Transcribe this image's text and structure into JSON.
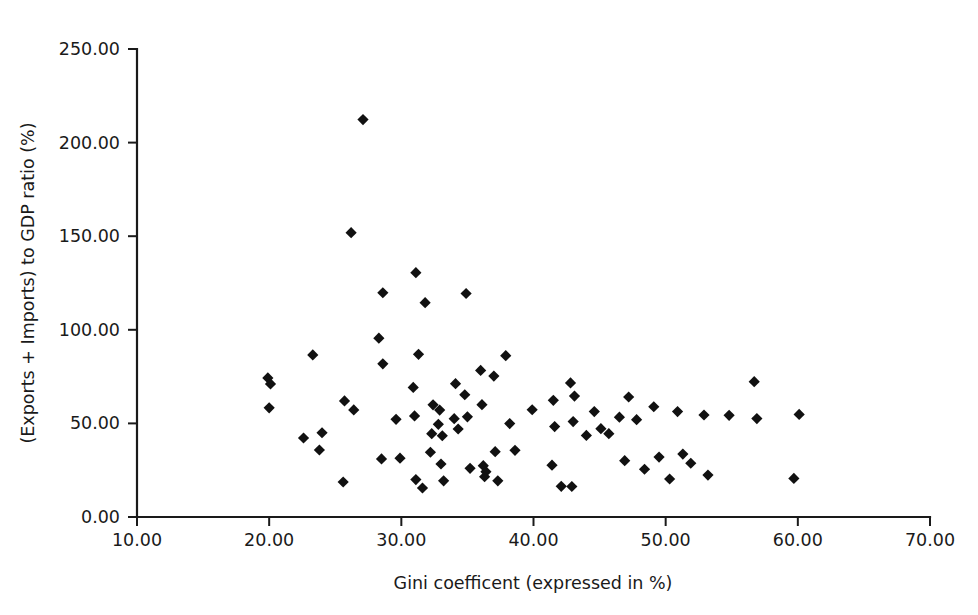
{
  "figure": {
    "background_color": "#ffffff",
    "foreground_color": "#1a1a1a",
    "marker_color": "#111111",
    "marker_shape": "diamond",
    "width": 978,
    "height": 615
  },
  "chart_data": {
    "type": "scatter",
    "title": "",
    "xlabel": "Gini coefficent (expressed in %)",
    "ylabel": "(Exports + Imports) to GDP ratio (%)",
    "xlim": [
      10.0,
      70.0
    ],
    "ylim": [
      0.0,
      250.0
    ],
    "xticks": [
      10.0,
      20.0,
      30.0,
      40.0,
      50.0,
      60.0,
      70.0
    ],
    "yticks": [
      0.0,
      50.0,
      100.0,
      150.0,
      200.0,
      250.0
    ],
    "xticklabels": [
      "10.00",
      "20.00",
      "30.00",
      "40.00",
      "50.00",
      "60.00",
      "70.00"
    ],
    "yticklabels": [
      "0.00",
      "50.00",
      "100.00",
      "150.00",
      "200.00",
      "250.00"
    ],
    "grid": false,
    "legend": null,
    "legend_position": "none",
    "marker": "diamond",
    "n_points": 82,
    "points": [
      {
        "x": 19.9,
        "y": 74.3
      },
      {
        "x": 20.1,
        "y": 71.1
      },
      {
        "x": 20.0,
        "y": 58.3
      },
      {
        "x": 23.3,
        "y": 86.6
      },
      {
        "x": 22.6,
        "y": 42.2
      },
      {
        "x": 24.0,
        "y": 45.0
      },
      {
        "x": 23.8,
        "y": 35.8
      },
      {
        "x": 25.7,
        "y": 62.0
      },
      {
        "x": 26.4,
        "y": 57.2
      },
      {
        "x": 25.6,
        "y": 18.7
      },
      {
        "x": 27.1,
        "y": 212.3
      },
      {
        "x": 26.2,
        "y": 151.9
      },
      {
        "x": 28.6,
        "y": 119.8
      },
      {
        "x": 28.3,
        "y": 95.5
      },
      {
        "x": 28.6,
        "y": 81.8
      },
      {
        "x": 28.5,
        "y": 31.0
      },
      {
        "x": 29.9,
        "y": 31.4
      },
      {
        "x": 31.1,
        "y": 130.5
      },
      {
        "x": 31.8,
        "y": 114.5
      },
      {
        "x": 31.3,
        "y": 86.9
      },
      {
        "x": 30.9,
        "y": 69.2
      },
      {
        "x": 31.0,
        "y": 54.0
      },
      {
        "x": 31.1,
        "y": 20.0
      },
      {
        "x": 31.6,
        "y": 15.5
      },
      {
        "x": 32.4,
        "y": 59.9
      },
      {
        "x": 32.3,
        "y": 44.5
      },
      {
        "x": 32.2,
        "y": 34.6
      },
      {
        "x": 32.9,
        "y": 57.1
      },
      {
        "x": 32.8,
        "y": 49.5
      },
      {
        "x": 33.1,
        "y": 43.4
      },
      {
        "x": 33.0,
        "y": 28.3
      },
      {
        "x": 33.2,
        "y": 19.3
      },
      {
        "x": 34.1,
        "y": 71.2
      },
      {
        "x": 34.0,
        "y": 52.5
      },
      {
        "x": 34.3,
        "y": 47.0
      },
      {
        "x": 34.9,
        "y": 119.4
      },
      {
        "x": 34.8,
        "y": 65.3
      },
      {
        "x": 35.0,
        "y": 53.5
      },
      {
        "x": 35.2,
        "y": 26.0
      },
      {
        "x": 36.0,
        "y": 78.3
      },
      {
        "x": 36.1,
        "y": 60.0
      },
      {
        "x": 36.2,
        "y": 27.4
      },
      {
        "x": 36.4,
        "y": 24.2
      },
      {
        "x": 36.3,
        "y": 21.5
      },
      {
        "x": 37.0,
        "y": 75.3
      },
      {
        "x": 37.1,
        "y": 34.9
      },
      {
        "x": 37.3,
        "y": 19.3
      },
      {
        "x": 37.9,
        "y": 86.2
      },
      {
        "x": 38.2,
        "y": 49.9
      },
      {
        "x": 39.9,
        "y": 57.3
      },
      {
        "x": 41.5,
        "y": 62.3
      },
      {
        "x": 41.6,
        "y": 48.3
      },
      {
        "x": 41.4,
        "y": 27.7
      },
      {
        "x": 42.1,
        "y": 16.4
      },
      {
        "x": 42.8,
        "y": 71.6
      },
      {
        "x": 43.1,
        "y": 64.6
      },
      {
        "x": 43.0,
        "y": 51.0
      },
      {
        "x": 42.9,
        "y": 16.3
      },
      {
        "x": 44.0,
        "y": 43.6
      },
      {
        "x": 44.6,
        "y": 56.3
      },
      {
        "x": 45.1,
        "y": 47.2
      },
      {
        "x": 45.7,
        "y": 44.5
      },
      {
        "x": 46.5,
        "y": 53.3
      },
      {
        "x": 47.2,
        "y": 64.1
      },
      {
        "x": 46.9,
        "y": 30.1
      },
      {
        "x": 47.8,
        "y": 52.0
      },
      {
        "x": 48.4,
        "y": 25.5
      },
      {
        "x": 49.1,
        "y": 58.9
      },
      {
        "x": 49.5,
        "y": 32.0
      },
      {
        "x": 50.3,
        "y": 20.3
      },
      {
        "x": 50.9,
        "y": 56.3
      },
      {
        "x": 51.3,
        "y": 33.6
      },
      {
        "x": 51.9,
        "y": 28.7
      },
      {
        "x": 52.9,
        "y": 54.5
      },
      {
        "x": 53.2,
        "y": 22.4
      },
      {
        "x": 54.8,
        "y": 54.3
      },
      {
        "x": 56.7,
        "y": 72.3
      },
      {
        "x": 56.9,
        "y": 52.6
      },
      {
        "x": 59.7,
        "y": 20.6
      },
      {
        "x": 60.1,
        "y": 54.8
      },
      {
        "x": 29.6,
        "y": 52.2
      },
      {
        "x": 38.6,
        "y": 35.6
      }
    ]
  }
}
